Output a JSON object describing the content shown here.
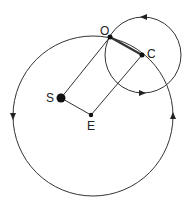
{
  "diagram": {
    "colors": {
      "stroke": "#333333",
      "fill": "#111111",
      "background": "#ffffff"
    },
    "labels": {
      "S": "S",
      "E": "E",
      "O": "O",
      "C": "C"
    },
    "points": {
      "S": {
        "x": 61,
        "y": 98,
        "r": 4.5
      },
      "E": {
        "x": 91,
        "y": 115,
        "r": 2.2
      },
      "O": {
        "x": 110,
        "y": 37,
        "r": 2.2
      },
      "C": {
        "x": 142,
        "y": 55,
        "r": 2.2
      }
    },
    "circles": {
      "large": {
        "cx": 93,
        "cy": 116,
        "r": 80
      },
      "small": {
        "cx": 143,
        "cy": 55,
        "r": 38
      }
    }
  }
}
